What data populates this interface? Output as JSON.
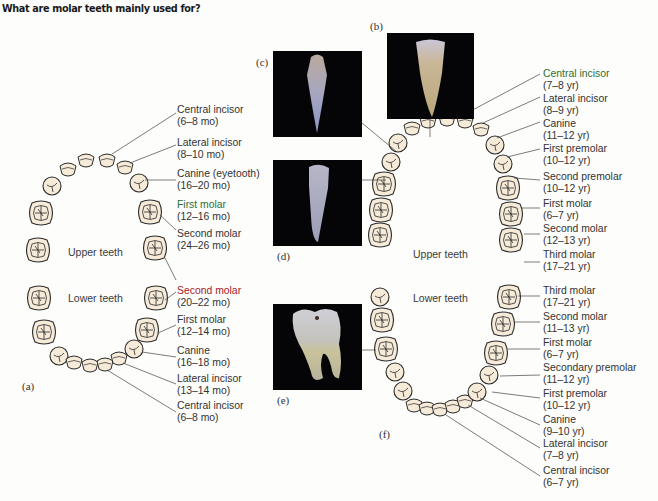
{
  "question": "What are molar teeth mainly used for?",
  "panel_a": {
    "figure_label": "(a)",
    "upper_arch_label": "Upper teeth",
    "lower_arch_label": "Lower teeth",
    "upper_labels": [
      {
        "name": "Central incisor",
        "age": "(6–8 mo)"
      },
      {
        "name": "Lateral incisor",
        "age": "(8–10 mo)"
      },
      {
        "name": "Canine (eyetooth)",
        "age": "(16–20 mo)"
      },
      {
        "name": "First molar",
        "age": "(12–16 mo)"
      },
      {
        "name": "Second molar",
        "age": "(24–26 mo)"
      }
    ],
    "lower_labels": [
      {
        "name": "Second molar",
        "age": "(20–22 mo)"
      },
      {
        "name": "First molar",
        "age": "(12–14 mo)"
      },
      {
        "name": "Canine",
        "age": "(16–18 mo)"
      },
      {
        "name": "Lateral incisor",
        "age": "(13–14 mo)"
      },
      {
        "name": "Central incisor",
        "age": "(6–8 mo)"
      }
    ]
  },
  "photos": {
    "b": "(b)",
    "c": "(c)",
    "d": "(d)",
    "e": "(e)"
  },
  "panel_f": {
    "figure_label": "(f)",
    "upper_arch_label": "Upper teeth",
    "lower_arch_label": "Lower teeth",
    "upper_labels": [
      {
        "name": "Central incisor",
        "age": "(7–8 yr)"
      },
      {
        "name": "Lateral incisor",
        "age": "(8–9 yr)"
      },
      {
        "name": "Canine",
        "age": "(11–12 yr)"
      },
      {
        "name": "First premolar",
        "age": "(10–12 yr)"
      },
      {
        "name": "Second premolar",
        "age": "(10–12 yr)"
      },
      {
        "name": "First molar",
        "age": "(6–7 yr)"
      },
      {
        "name": "Second molar",
        "age": "(12–13 yr)"
      },
      {
        "name": "Third molar",
        "age": "(17–21 yr)"
      }
    ],
    "lower_labels": [
      {
        "name": "Third molar",
        "age": "(17–21 yr)"
      },
      {
        "name": "Second molar",
        "age": "(11–13 yr)"
      },
      {
        "name": "First molar",
        "age": "(6–7 yr)"
      },
      {
        "name": "Secondary premolar",
        "age": "(11–12 yr)"
      },
      {
        "name": "First premolar",
        "age": "(10–12 yr)"
      },
      {
        "name": "Canine",
        "age": "(9–10 yr)"
      },
      {
        "name": "Lateral incisor",
        "age": "(7–8 yr)"
      },
      {
        "name": "Central incisor",
        "age": "(6–7 yr)"
      }
    ]
  },
  "colors": {
    "tooth_fill": "#f6ead8",
    "tooth_stroke": "#2a2a2a",
    "photo_bg": "#050507",
    "accent_red": "#a3202a",
    "accent_green": "#2e6e35"
  }
}
